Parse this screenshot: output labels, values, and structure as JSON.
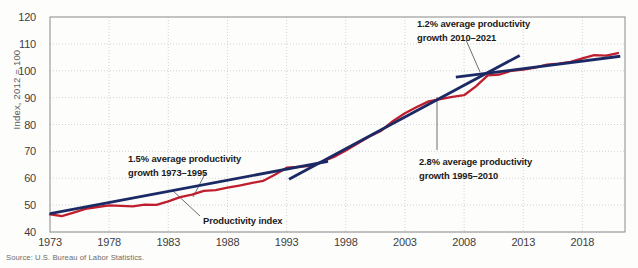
{
  "figure": {
    "source_note": "Source: U.S. Bureau of Labor Statistics."
  },
  "chart_data": {
    "type": "line",
    "title": "",
    "xlabel": "",
    "ylabel": "Index, 2012 = 100",
    "xlim": [
      1973,
      2021
    ],
    "ylim": [
      40,
      120
    ],
    "ytick_labels": [
      "120",
      "110",
      "100",
      "90",
      "80",
      "70",
      "60",
      "50",
      "40"
    ],
    "yticks": [
      120,
      110,
      100,
      90,
      80,
      70,
      60,
      50,
      40
    ],
    "xtick_labels": [
      "1973",
      "1978",
      "1983",
      "1988",
      "1993",
      "1998",
      "2003",
      "2008",
      "2013",
      "2018"
    ],
    "xticks": [
      1973,
      1978,
      1983,
      1988,
      1993,
      1998,
      2003,
      2008,
      2013,
      2018
    ],
    "grid": true,
    "legend_position": "none",
    "series": [
      {
        "name": "Productivity index",
        "color": "#bf1e2e",
        "x": [
          1973,
          1974,
          1975,
          1976,
          1977,
          1978,
          1979,
          1980,
          1981,
          1982,
          1983,
          1984,
          1985,
          1986,
          1987,
          1988,
          1989,
          1990,
          1991,
          1992,
          1993,
          1994,
          1995,
          1996,
          1997,
          1998,
          1999,
          2000,
          2001,
          2002,
          2003,
          2004,
          2005,
          2006,
          2007,
          2008,
          2009,
          2010,
          2011,
          2012,
          2013,
          2014,
          2015,
          2016,
          2017,
          2018,
          2019,
          2020,
          2021
        ],
        "y": [
          46.6,
          45.9,
          47.2,
          48.6,
          49.3,
          49.9,
          49.7,
          49.5,
          50.2,
          50.1,
          51.4,
          53.0,
          53.9,
          55.3,
          55.6,
          56.5,
          57.3,
          58.2,
          59.0,
          61.3,
          63.9,
          64.2,
          64.6,
          66.2,
          67.9,
          70.3,
          72.9,
          75.5,
          77.7,
          81.3,
          84.2,
          86.5,
          88.6,
          89.4,
          90.3,
          90.9,
          94.2,
          98.3,
          98.6,
          100.0,
          100.4,
          101.2,
          102.3,
          102.6,
          103.3,
          104.6,
          105.8,
          105.6,
          106.6
        ]
      }
    ],
    "trend_lines": [
      {
        "name": "trend-1973-1995",
        "label_rate": "1.5%",
        "color": "#1b2a64",
        "x0": 1973,
        "y0": 46.8,
        "x1": 1996.5,
        "y1": 66.3
      },
      {
        "name": "trend-1995-2010",
        "label_rate": "2.8%",
        "color": "#1b2a64",
        "x0": 1993.2,
        "y0": 59.6,
        "x1": 2012.7,
        "y1": 105.7
      },
      {
        "name": "trend-2010-2021",
        "label_rate": "1.2%",
        "color": "#1b2a64",
        "x0": 2007.3,
        "y0": 97.6,
        "x1": 2021.2,
        "y1": 105.4
      }
    ],
    "annotations": [
      {
        "name": "annotation-growth-1973-1995",
        "line1": "1.5% average productivity",
        "line2": "growth 1973–1995"
      },
      {
        "name": "annotation-growth-1995-2010",
        "line1": "2.8% average productivity",
        "line2": "growth 1995–2010"
      },
      {
        "name": "annotation-growth-2010-2021",
        "line1": "1.2% average productivity",
        "line2": "growth 2010–2021"
      },
      {
        "name": "annotation-productivity-index",
        "line1": "Productivity index",
        "line2": ""
      }
    ]
  }
}
